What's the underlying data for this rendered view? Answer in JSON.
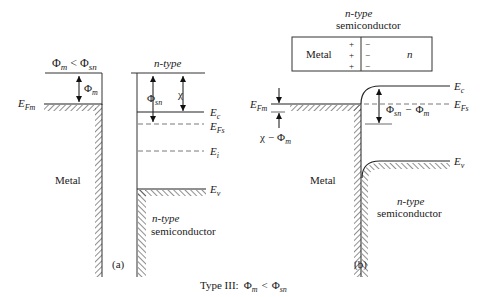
{
  "caption": "Type III:  Φm < Φsn",
  "caption_parts": {
    "prefix": "Type III:",
    "phi": "Φ",
    "m": "m",
    "lt": "<",
    "sn": "sn"
  },
  "panel_a": {
    "label": "(a)",
    "condition": {
      "phi": "Φ",
      "m": "m",
      "lt": "<",
      "sn": "sn"
    },
    "metal_label": "Metal",
    "phi_m": {
      "phi": "Φ",
      "sub": "m"
    },
    "efm": {
      "E": "E",
      "sub": "Fm"
    },
    "semiconductor_top_label": "n-type",
    "phi_sn": {
      "phi": "Φ",
      "sub": "sn"
    },
    "chi": "χ",
    "levels": {
      "ec": {
        "E": "E",
        "sub": "c"
      },
      "efs": {
        "E": "E",
        "sub": "Fs"
      },
      "ei": {
        "E": "E",
        "sub": "i"
      },
      "ev": {
        "E": "E",
        "sub": "v"
      }
    },
    "semiconductor_label_line1": "n-type",
    "semiconductor_label_line2": "semiconductor"
  },
  "panel_b": {
    "label": "(b)",
    "header_line1": "n-type",
    "header_line2": "semiconductor",
    "box": {
      "metal": "Metal",
      "plus": "+",
      "minus": "−",
      "n": "n"
    },
    "efm": {
      "E": "E",
      "sub": "Fm"
    },
    "chi_minus_phi": {
      "chi": "χ",
      "minus": "−",
      "phi": "Φ",
      "sub": "m"
    },
    "barrier": {
      "phi": "Φ",
      "sub1": "sn",
      "minus": "−",
      "phi2": "Φ",
      "sub2": "m"
    },
    "levels": {
      "ec": {
        "E": "E",
        "sub": "c"
      },
      "efs": {
        "E": "E",
        "sub": "Fs"
      },
      "ev": {
        "E": "E",
        "sub": "v"
      }
    },
    "metal_label": "Metal",
    "semiconductor_label_line1": "n-type",
    "semiconductor_label_line2": "semiconductor"
  }
}
